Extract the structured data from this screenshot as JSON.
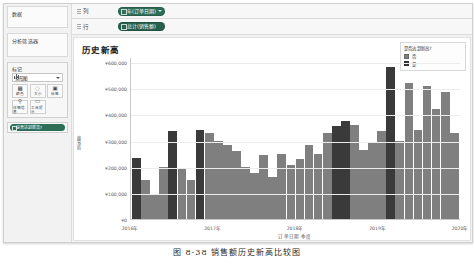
{
  "window": {
    "shelves": [
      {
        "label": "列",
        "pill": "年(订单日期)"
      },
      {
        "label": "行",
        "pill": "总计(销售额)"
      }
    ]
  },
  "sidebar": {
    "data_pane": {
      "title": "数据",
      "sub": ""
    },
    "analytics_pane": {
      "title": "分析筛选器",
      "sub": ""
    },
    "marks": {
      "title": "标记",
      "mark_type": "条形图",
      "buttons": [
        {
          "label": "颜色",
          "icon": "color-palette-icon",
          "glyph": "▦"
        },
        {
          "label": "大小",
          "icon": "size-icon",
          "glyph": "◌"
        },
        {
          "label": "标签",
          "icon": "label-icon",
          "glyph": "▣"
        },
        {
          "label": "详细信息",
          "icon": "detail-icon",
          "glyph": "⚲"
        },
        {
          "label": "工具提示",
          "icon": "tooltip-icon",
          "glyph": "▭"
        }
      ],
      "color_pill": "是否达到新高?"
    }
  },
  "chart_panel": {
    "title": "历史新高",
    "legend": {
      "title": "是否达到新高?",
      "items": [
        {
          "label": "否",
          "color": "#7f7f7f"
        },
        {
          "label": "是",
          "color": "#3a3a3a"
        }
      ]
    }
  },
  "caption": "图 8-38  销售额历史新高比较图",
  "chart_data": {
    "type": "bar",
    "title": "历史新高",
    "xlabel": "订单日期 季度",
    "ylabel": "销售额",
    "ylim": [
      0,
      620000
    ],
    "ytick_labels": [
      "¥0",
      "¥100,000",
      "¥200,000",
      "¥300,000",
      "¥400,000",
      "¥500,000",
      "¥600,000"
    ],
    "ytick_values": [
      0,
      100000,
      200000,
      300000,
      400000,
      500000,
      600000
    ],
    "xtick_labels": [
      "2016年",
      "2017年",
      "2018年",
      "2019年",
      "2020年"
    ],
    "grid": true,
    "legend_position": "top-right",
    "series": [
      {
        "name": "销售额",
        "categories": [
          "2016 Q1",
          "2016 Q2",
          "2016 Q3",
          "2016 Q4",
          "2017 Q1",
          "2017 Q2",
          "2017 Q3",
          "2017 Q4",
          "2018 Q1",
          "2018 Q2",
          "2018 Q3",
          "2018 Q4",
          "2019 Q1",
          "2019 Q2",
          "2019 Q3",
          "2019 Q4",
          "2020 Q1",
          "2020 Q2",
          "2020 Q3",
          "2020 Q4",
          "2021 Q1",
          "2021 Q2",
          "2021 Q3",
          "2021 Q4",
          "2022 Q1",
          "2022 Q2",
          "2022 Q3",
          "2022 Q4",
          "2023 Q1",
          "2023 Q2",
          "2023 Q3",
          "2023 Q4",
          "2024 Q1",
          "2024 Q2",
          "2024 Q3",
          "2024 Q4"
        ],
        "values": [
          235000,
          150000,
          95000,
          200000,
          335000,
          190000,
          150000,
          340000,
          330000,
          300000,
          285000,
          260000,
          200000,
          175000,
          245000,
          160000,
          250000,
          205000,
          230000,
          285000,
          250000,
          330000,
          355000,
          375000,
          360000,
          265000,
          290000,
          335000,
          580000,
          300000,
          520000,
          340000,
          510000,
          420000,
          485000,
          330000
        ],
        "new_high": [
          true,
          false,
          false,
          false,
          true,
          false,
          false,
          true,
          false,
          false,
          false,
          false,
          false,
          false,
          false,
          false,
          false,
          false,
          false,
          false,
          false,
          false,
          true,
          true,
          false,
          false,
          false,
          false,
          true,
          false,
          false,
          false,
          false,
          false,
          false,
          false
        ]
      }
    ],
    "colors": {
      "normal": "#7f7f7f",
      "high": "#3a3a3a"
    }
  }
}
